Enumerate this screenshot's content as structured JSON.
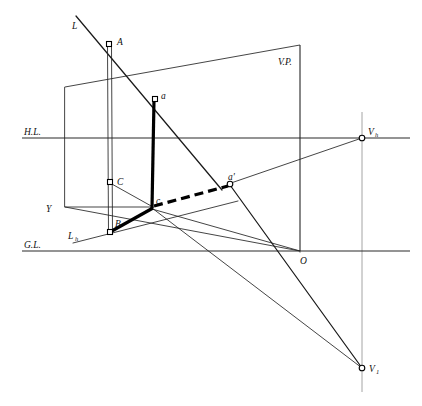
{
  "figure": {
    "width": 422,
    "height": 406,
    "background": "#ffffff",
    "ink": "#000000"
  },
  "reference_lines": {
    "horizon": {
      "name": "H.L.",
      "label": "H.L.",
      "y": 138,
      "x1": 22,
      "x2": 410
    },
    "ground": {
      "name": "G.L.",
      "label": "G.L.",
      "y": 251,
      "x1": 22,
      "x2": 410
    }
  },
  "labels": {
    "line_L": "L",
    "line_Lh": "L",
    "line_Lh_sub": "h",
    "point_A": "A",
    "point_B": "B",
    "point_C": "C",
    "point_Y": "Y",
    "point_O": "O",
    "point_a": "a",
    "point_a_prime": "a'",
    "point_c": "c",
    "vertical_plane": "V.P.",
    "vp_horizontal": "V",
    "vp_horizontal_sub": "h",
    "vp_inclined": "V",
    "vp_inclined_sub": "1",
    "horizon_line": "H.L.",
    "ground_line": "G.L."
  },
  "points": {
    "A": {
      "x": 109,
      "y": 44,
      "marker": "square"
    },
    "a": {
      "x": 155,
      "y": 99,
      "marker": "square"
    },
    "C": {
      "x": 110,
      "y": 182,
      "marker": "square"
    },
    "B": {
      "x": 110,
      "y": 232,
      "marker": "square"
    },
    "c": {
      "x": 152,
      "y": 207,
      "marker": "none"
    },
    "ap": {
      "x": 230,
      "y": 184,
      "marker": "circle"
    },
    "Vh": {
      "x": 362,
      "y": 138,
      "marker": "circle"
    },
    "V1": {
      "x": 362,
      "y": 368,
      "marker": "circle"
    },
    "O": {
      "x": 300,
      "y": 251,
      "marker": "none"
    },
    "Y": {
      "x": 65,
      "y": 207,
      "marker": "none"
    }
  },
  "picture_plane": {
    "name": "V.P. quadrilateral",
    "corners": [
      {
        "x": 65,
        "y": 87
      },
      {
        "x": 300,
        "y": 45
      },
      {
        "x": 300,
        "y": 251
      },
      {
        "x": 65,
        "y": 207
      }
    ]
  },
  "segments": [
    {
      "name": "line-L-through-A",
      "weight": "medium",
      "from": {
        "x": 76,
        "y": 16
      },
      "to": {
        "x": 222,
        "y": 190
      }
    },
    {
      "name": "trace-Lh",
      "weight": "thin",
      "from": {
        "x": 73,
        "y": 243
      },
      "to": {
        "x": 236,
        "y": 202
      }
    },
    {
      "name": "AB-vertical-double",
      "weight": "double-rail",
      "from": {
        "x": 109,
        "y": 44
      },
      "to": {
        "x": 110,
        "y": 232
      }
    },
    {
      "name": "a-to-c-vertical",
      "weight": "thick",
      "from": {
        "x": 155,
        "y": 99
      },
      "to": {
        "x": 152,
        "y": 209
      }
    },
    {
      "name": "c-to-a-prime-dashed",
      "weight": "thick-dashed",
      "from": {
        "x": 152,
        "y": 207
      },
      "to": {
        "x": 228,
        "y": 186
      }
    },
    {
      "name": "B-to-c-thick",
      "weight": "thick",
      "from": {
        "x": 110,
        "y": 232
      },
      "to": {
        "x": 154,
        "y": 208
      }
    },
    {
      "name": "C-to-c-thin",
      "weight": "thin",
      "from": {
        "x": 110,
        "y": 182
      },
      "to": {
        "x": 153,
        "y": 207
      }
    },
    {
      "name": "Y-to-c-thin",
      "weight": "thin",
      "from": {
        "x": 65,
        "y": 207
      },
      "to": {
        "x": 153,
        "y": 207
      }
    },
    {
      "name": "a-prime-to-Vh",
      "weight": "thin",
      "from": {
        "x": 231,
        "y": 183
      },
      "to": {
        "x": 362,
        "y": 138
      }
    },
    {
      "name": "a-prime-to-V1-thick",
      "weight": "medium",
      "from": {
        "x": 230,
        "y": 185
      },
      "to": {
        "x": 362,
        "y": 368
      }
    },
    {
      "name": "c-to-V1-thin",
      "weight": "thin",
      "from": {
        "x": 152,
        "y": 208
      },
      "to": {
        "x": 362,
        "y": 368
      }
    },
    {
      "name": "c-to-O-thin",
      "weight": "thin",
      "from": {
        "x": 152,
        "y": 208
      },
      "to": {
        "x": 300,
        "y": 251
      }
    },
    {
      "name": "Vh-vertical-drop",
      "weight": "rail",
      "from": {
        "x": 362,
        "y": 118
      },
      "to": {
        "x": 362,
        "y": 390
      }
    },
    {
      "name": "plane-right-edge",
      "weight": "thin",
      "from": {
        "x": 300,
        "y": 45
      },
      "to": {
        "x": 300,
        "y": 251
      }
    }
  ],
  "markers": {
    "square_size": 5,
    "circle_radius": 2.6
  }
}
